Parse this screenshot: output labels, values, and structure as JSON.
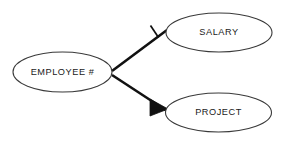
{
  "diagram": {
    "type": "entity-relationship-diagram",
    "background_color": "#ffffff",
    "line_color": "#111111",
    "ellipse_stroke_color": "#3a3a3a",
    "text_color": "#1a1a1a",
    "width": 282,
    "height": 142,
    "entities": [
      {
        "id": "employee",
        "label": "EMPLOYEE #",
        "shape": "ellipse",
        "cx": 62.5,
        "cy": 72,
        "rx": 49.5,
        "ry": 20
      },
      {
        "id": "salary",
        "label": "SALARY",
        "shape": "ellipse",
        "cx": 219,
        "cy": 32.5,
        "rx": 53,
        "ry": 19.5
      },
      {
        "id": "project",
        "label": "PROJECT",
        "shape": "ellipse",
        "cx": 218.5,
        "cy": 112.5,
        "rx": 53,
        "ry": 19.5
      }
    ],
    "relationships": [
      {
        "id": "employee-salary",
        "from": "employee",
        "to": "salary",
        "cardinality": "one",
        "notation": "perpendicular-tick",
        "x1": 112,
        "y1": 71,
        "x2": 167,
        "y2": 30
      },
      {
        "id": "employee-project",
        "from": "employee",
        "to": "project",
        "cardinality": "many",
        "notation": "crows-foot",
        "x1": 112,
        "y1": 75,
        "x2": 167,
        "y2": 111
      }
    ]
  }
}
